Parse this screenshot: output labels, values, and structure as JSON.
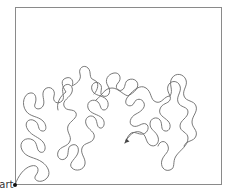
{
  "diagram": {
    "type": "free-motion quilting meander (stipple) path",
    "start_label": "Start",
    "colors": {
      "border": "#8a8a8a",
      "path": "#6a6a6a",
      "start_dot": "#111111",
      "background": "#ffffff"
    },
    "frame": {
      "x": 15,
      "y": 7,
      "width": 207,
      "height": 178
    },
    "start_point": {
      "x": 15,
      "y": 185
    },
    "end_arrow_point": {
      "x": 125,
      "y": 143
    }
  }
}
